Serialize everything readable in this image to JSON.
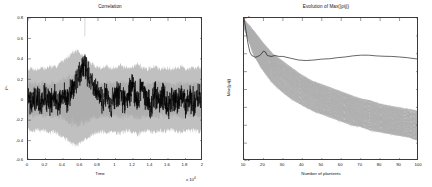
{
  "figure": {
    "background": "#ffffff",
    "axis_color": "#3a3a3a",
    "series_colors": {
      "ensemble": "#b3b3b3",
      "highlight": "#000000"
    }
  },
  "chart_data": [
    {
      "id": "correlation",
      "type": "line",
      "title": "Correlation",
      "xlabel": "Time",
      "ylabel": "ρ₀",
      "x_exponent_label": "x 10",
      "x_exponent_sup": "4",
      "xlim": [
        0,
        2
      ],
      "ylim": [
        -0.6,
        0.8
      ],
      "grid": false,
      "legend": "none",
      "xticks": [
        "0",
        "0.2",
        "0.4",
        "0.6",
        "0.8",
        "1",
        "1.2",
        "1.4",
        "1.6",
        "1.8",
        "2"
      ],
      "xtick_values": [
        0,
        0.2,
        0.4,
        0.6,
        0.8,
        1,
        1.2,
        1.4,
        1.6,
        1.8,
        2
      ],
      "yticks": [
        "0.8",
        "0.6",
        "0.4",
        "0.2",
        "0",
        "-0.2",
        "-0.4",
        "-0.6"
      ],
      "ytick_values": [
        0.8,
        0.6,
        0.4,
        0.2,
        0,
        -0.2,
        -0.4,
        -0.6
      ],
      "series": [
        {
          "name": "ensemble-envelope",
          "role": "gray-noise-band",
          "color": "#b3b3b3",
          "description": "dense band of gray noise traces centred near 0",
          "band_upper": [
            0.3,
            0.31,
            0.29,
            0.32,
            0.3,
            0.33,
            0.31,
            0.35,
            0.38,
            0.42,
            0.46,
            0.48,
            0.45,
            0.41,
            0.37,
            0.34,
            0.32,
            0.31,
            0.33,
            0.3,
            0.32,
            0.34,
            0.31,
            0.3,
            0.33,
            0.35,
            0.32,
            0.3,
            0.31,
            0.33,
            0.3,
            0.32,
            0.31,
            0.29,
            0.31,
            0.33,
            0.3,
            0.31,
            0.3,
            0.32,
            0.3
          ],
          "band_lower": [
            -0.3,
            -0.32,
            -0.29,
            -0.31,
            -0.3,
            -0.33,
            -0.31,
            -0.34,
            -0.36,
            -0.4,
            -0.43,
            -0.45,
            -0.42,
            -0.39,
            -0.36,
            -0.34,
            -0.32,
            -0.31,
            -0.33,
            -0.3,
            -0.32,
            -0.33,
            -0.31,
            -0.3,
            -0.32,
            -0.34,
            -0.32,
            -0.3,
            -0.31,
            -0.32,
            -0.3,
            -0.31,
            -0.3,
            -0.29,
            -0.31,
            -0.32,
            -0.3,
            -0.31,
            -0.3,
            -0.31,
            -0.3
          ]
        },
        {
          "name": "reference-correlation",
          "role": "black-trace",
          "color": "#000000",
          "description": "black noisy correlation trace with large excursion near t = 0.62e4",
          "x": [
            0.0,
            0.05,
            0.1,
            0.15,
            0.2,
            0.25,
            0.3,
            0.35,
            0.4,
            0.45,
            0.5,
            0.55,
            0.6,
            0.65,
            0.7,
            0.75,
            0.8,
            0.85,
            0.9,
            0.95,
            1.0,
            1.05,
            1.1,
            1.15,
            1.2,
            1.25,
            1.3,
            1.35,
            1.4,
            1.45,
            1.5,
            1.55,
            1.6,
            1.65,
            1.7,
            1.75,
            1.8,
            1.85,
            1.9,
            1.95,
            2.0
          ],
          "y": [
            0.02,
            -0.05,
            0.06,
            -0.08,
            0.04,
            -0.1,
            0.08,
            -0.06,
            0.1,
            -0.04,
            0.18,
            0.34,
            0.48,
            0.62,
            0.4,
            0.22,
            0.12,
            -0.02,
            0.14,
            -0.08,
            0.06,
            0.18,
            -0.06,
            0.1,
            0.22,
            -0.04,
            0.28,
            0.04,
            -0.1,
            0.12,
            -0.06,
            0.08,
            -0.12,
            0.06,
            -0.04,
            0.1,
            -0.08,
            0.04,
            -0.06,
            0.08,
            -0.02
          ],
          "peak": {
            "x": 0.65,
            "y": 0.62
          }
        }
      ]
    },
    {
      "id": "evolution-max",
      "type": "line",
      "title": "Evolution of Max(|ρij|)",
      "xlabel": "Number of plantents",
      "ylabel": "Max(|ρij|)",
      "xlim": [
        10,
        100
      ],
      "ylim": [
        0.2,
        1.0
      ],
      "grid": false,
      "legend": "none",
      "xticks": [
        "10",
        "20",
        "30",
        "40",
        "50",
        "60",
        "70",
        "80",
        "90",
        "100"
      ],
      "xtick_values": [
        10,
        20,
        30,
        40,
        50,
        60,
        70,
        80,
        90,
        100
      ],
      "yticks": [
        "1",
        "0.9",
        "0.8",
        "0.7",
        "0.6",
        "0.5",
        "0.4",
        "0.3",
        "0.2"
      ],
      "ytick_values": [
        1,
        0.9,
        0.8,
        0.7,
        0.6,
        0.5,
        0.4,
        0.3,
        0.2
      ],
      "series": [
        {
          "name": "ensemble-runs",
          "role": "gray-bundle",
          "color": "#b3b3b3",
          "description": "large bundle of decaying gray curves from ~0.98 down to ~0.3-0.45",
          "x": [
            10,
            15,
            20,
            25,
            30,
            35,
            40,
            45,
            50,
            55,
            60,
            65,
            70,
            75,
            80,
            85,
            90,
            95,
            100
          ],
          "upper": [
            0.99,
            0.93,
            0.86,
            0.8,
            0.76,
            0.72,
            0.68,
            0.65,
            0.63,
            0.61,
            0.59,
            0.57,
            0.55,
            0.54,
            0.52,
            0.51,
            0.5,
            0.49,
            0.48
          ],
          "median": [
            0.97,
            0.86,
            0.78,
            0.72,
            0.67,
            0.63,
            0.6,
            0.57,
            0.54,
            0.52,
            0.5,
            0.48,
            0.46,
            0.45,
            0.43,
            0.42,
            0.41,
            0.4,
            0.39
          ],
          "lower": [
            0.95,
            0.79,
            0.7,
            0.63,
            0.58,
            0.54,
            0.51,
            0.48,
            0.46,
            0.44,
            0.42,
            0.4,
            0.39,
            0.37,
            0.36,
            0.35,
            0.34,
            0.33,
            0.31
          ]
        },
        {
          "name": "reference-run",
          "role": "black-trace",
          "color": "#000000",
          "description": "black curve falling from 1.0 to ~0.79 then nearly flat around 0.77",
          "x": [
            10,
            11,
            12,
            13,
            14,
            15,
            16,
            17,
            18,
            19,
            20,
            21,
            22,
            24,
            26,
            28,
            30,
            34,
            38,
            42,
            46,
            50,
            54,
            58,
            62,
            66,
            70,
            74,
            78,
            82,
            86,
            90,
            94,
            98,
            100
          ],
          "y": [
            1.0,
            0.93,
            0.86,
            0.81,
            0.79,
            0.785,
            0.78,
            0.785,
            0.79,
            0.8,
            0.815,
            0.81,
            0.79,
            0.785,
            0.79,
            0.785,
            0.785,
            0.775,
            0.765,
            0.762,
            0.765,
            0.77,
            0.772,
            0.778,
            0.782,
            0.788,
            0.792,
            0.792,
            0.788,
            0.786,
            0.785,
            0.782,
            0.778,
            0.772,
            0.77
          ]
        }
      ]
    }
  ]
}
